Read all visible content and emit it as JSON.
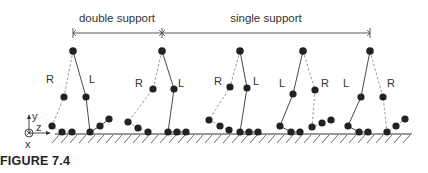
{
  "figure": {
    "caption": "FIGURE 7.4",
    "phases": [
      {
        "label": "double support",
        "x1": 73,
        "x2": 162
      },
      {
        "label": "single support",
        "x1": 162,
        "x2": 370
      }
    ],
    "axes": {
      "y_label": "y",
      "z_label": "z",
      "x_label": "x"
    },
    "leg_labels": {
      "right": "R",
      "left": "L"
    },
    "colors": {
      "ink": "#333333",
      "dashed": "#999999",
      "joint": "#222222"
    },
    "poses": [
      {
        "hip": [
          73,
          51
        ],
        "R": {
          "knee": [
            64,
            97
          ],
          "ankle": [
            52,
            126
          ],
          "foot": [
            [
              62,
              132
            ],
            [
              72,
              132
            ]
          ],
          "label": [
            46,
            83
          ]
        },
        "L": {
          "knee": [
            86,
            97
          ],
          "ankle": [
            90,
            132
          ],
          "foot": [
            [
              100,
              126
            ],
            [
              109,
              119
            ]
          ],
          "label": [
            89,
            83
          ]
        }
      },
      {
        "hip": [
          162,
          51
        ],
        "R": {
          "knee": [
            153,
            89
          ],
          "ankle": [
            128,
            122
          ],
          "foot": [
            [
              138,
              128
            ],
            [
              148,
              132
            ]
          ],
          "label": [
            135,
            87
          ]
        },
        "L": {
          "knee": [
            174,
            89
          ],
          "ankle": [
            168,
            132
          ],
          "foot": [
            [
              177,
              132
            ],
            [
              186,
              132
            ]
          ],
          "label": [
            178,
            87
          ]
        }
      },
      {
        "hip": [
          240,
          51
        ],
        "R": {
          "knee": [
            230,
            87
          ],
          "ankle": [
            209,
            120
          ],
          "foot": [
            [
              220,
              126
            ],
            [
              229,
              130
            ]
          ],
          "label": [
            214,
            85
          ]
        },
        "L": {
          "knee": [
            247,
            88
          ],
          "ankle": [
            240,
            132
          ],
          "foot": [
            [
              249,
              132
            ],
            [
              258,
              132
            ]
          ],
          "label": [
            253,
            85
          ]
        }
      },
      {
        "hip": [
          303,
          51
        ],
        "L": {
          "knee": [
            293,
            94
          ],
          "ankle": [
            280,
            126
          ],
          "foot": [
            [
              291,
              132
            ],
            [
              300,
              132
            ]
          ],
          "label": [
            279,
            87
          ]
        },
        "R": {
          "knee": [
            315,
            90
          ],
          "ankle": [
            312,
            127
          ],
          "foot": [
            [
              322,
              123
            ],
            [
              331,
              120
            ]
          ],
          "label": [
            321,
            87
          ]
        }
      },
      {
        "hip": [
          370,
          51
        ],
        "L": {
          "knee": [
            361,
            97
          ],
          "ankle": [
            348,
            126
          ],
          "foot": [
            [
              359,
              132
            ],
            [
              368,
              132
            ]
          ],
          "label": [
            343,
            87
          ]
        },
        "R": {
          "knee": [
            383,
            97
          ],
          "ankle": [
            387,
            132
          ],
          "foot": [
            [
              396,
              126
            ],
            [
              405,
              119
            ]
          ],
          "label": [
            387,
            87
          ]
        }
      }
    ],
    "ground": {
      "y": 134,
      "x1": 55,
      "x2": 412
    }
  }
}
